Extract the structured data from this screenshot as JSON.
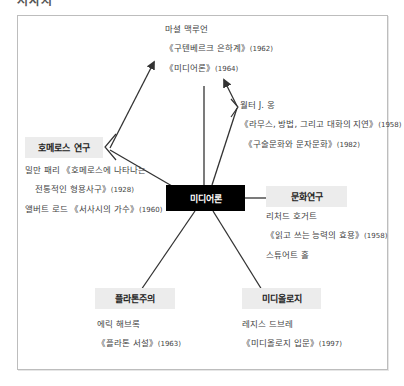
{
  "header": {
    "cut_off_heading": "서사시"
  },
  "diagram": {
    "center": {
      "label": "미디어론"
    },
    "nodes": {
      "homer": {
        "label": "호메로스 연구"
      },
      "culture": {
        "label": "문화연구"
      },
      "platonism": {
        "label": "플라톤주의"
      },
      "mediology": {
        "label": "미디올로지"
      }
    },
    "authors": {
      "mcluhan": {
        "name": "마셜 맥루언",
        "works": [
          {
            "title": "《구텐베르크 은하계》",
            "year": "(1962)"
          },
          {
            "title": "《미디어론》",
            "year": "(1964)"
          }
        ]
      },
      "ong": {
        "name": "월터 J. 옹",
        "works": [
          {
            "title": "《라무스, 방법, 그리고 대화의 지연》",
            "year": "(1958)"
          },
          {
            "title": "《구술문화와 문자문화》",
            "year": "(1982)"
          }
        ]
      },
      "homer_scholars": {
        "line1": "밀만 패리 《호메로스에 나타나는",
        "line2": "전통적인 형용사구》",
        "line2_year": "(1928)",
        "line3": "앨버트 로드 《서사시의 가수》",
        "line3_year": "(1960)"
      },
      "culture_scholars": {
        "name1": "리처드 호거트",
        "work1": "《읽고 쓰는 능력의 효용》",
        "work1_year": "(1958)",
        "name2": "스튜어트 홀"
      },
      "platonism_scholar": {
        "name": "에릭 해브록",
        "work": "《플라톤 서설》",
        "year": "(1963)"
      },
      "mediology_scholar": {
        "name": "레지스 드브레",
        "work": "《미디올로지 입문》",
        "year": "(1997)"
      }
    },
    "colors": {
      "center_bg": "#000000",
      "center_text": "#ffffff",
      "node_bg": "#ececec",
      "line": "#333333",
      "frame": "#bdbdbd"
    }
  }
}
